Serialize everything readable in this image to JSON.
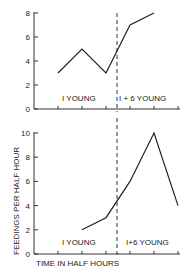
{
  "chart_data": [
    {
      "type": "line",
      "title": "",
      "xlabel": "",
      "ylabel": "FEEDINGS PER HALF HOUR",
      "ylim": [
        0,
        8
      ],
      "yticks": [
        0,
        2,
        4,
        6,
        8
      ],
      "x": [
        1,
        2,
        3,
        4,
        5
      ],
      "series": [
        {
          "name": "feedings",
          "values": [
            3,
            5,
            3,
            7,
            8
          ]
        }
      ],
      "divider_x": 3.5,
      "annotations": [
        "I  YOUNG",
        "I + 6  YOUNG"
      ],
      "grid": false
    },
    {
      "type": "line",
      "title": "",
      "xlabel": "TIME  IN  HALF  HOURS",
      "ylabel": "FEEDINGS PER HALF HOUR",
      "ylim": [
        0,
        10
      ],
      "yticks": [
        0,
        2,
        4,
        6,
        8,
        10
      ],
      "x": [
        2,
        3,
        4,
        5,
        6
      ],
      "series": [
        {
          "name": "feedings",
          "values": [
            2,
            3,
            6,
            10,
            4
          ]
        }
      ],
      "divider_x": 3.5,
      "annotations": [
        "I  YOUNG",
        "I+6 YOUNG"
      ],
      "grid": false
    }
  ],
  "labels": {
    "ylabel": "FEEDINGS  PER  HALF  HOUR",
    "xlabel": "TIME  IN  HALF  HOURS",
    "top_left_annot": "I  YOUNG",
    "top_right_annot": "I + 6  YOUNG",
    "bottom_left_annot": "I  YOUNG",
    "bottom_right_annot": "I+6 YOUNG",
    "top_yticks": [
      "0",
      "2",
      "4",
      "6",
      "8"
    ],
    "bottom_yticks": [
      "0",
      "2",
      "4",
      "6",
      "8",
      "10"
    ]
  }
}
